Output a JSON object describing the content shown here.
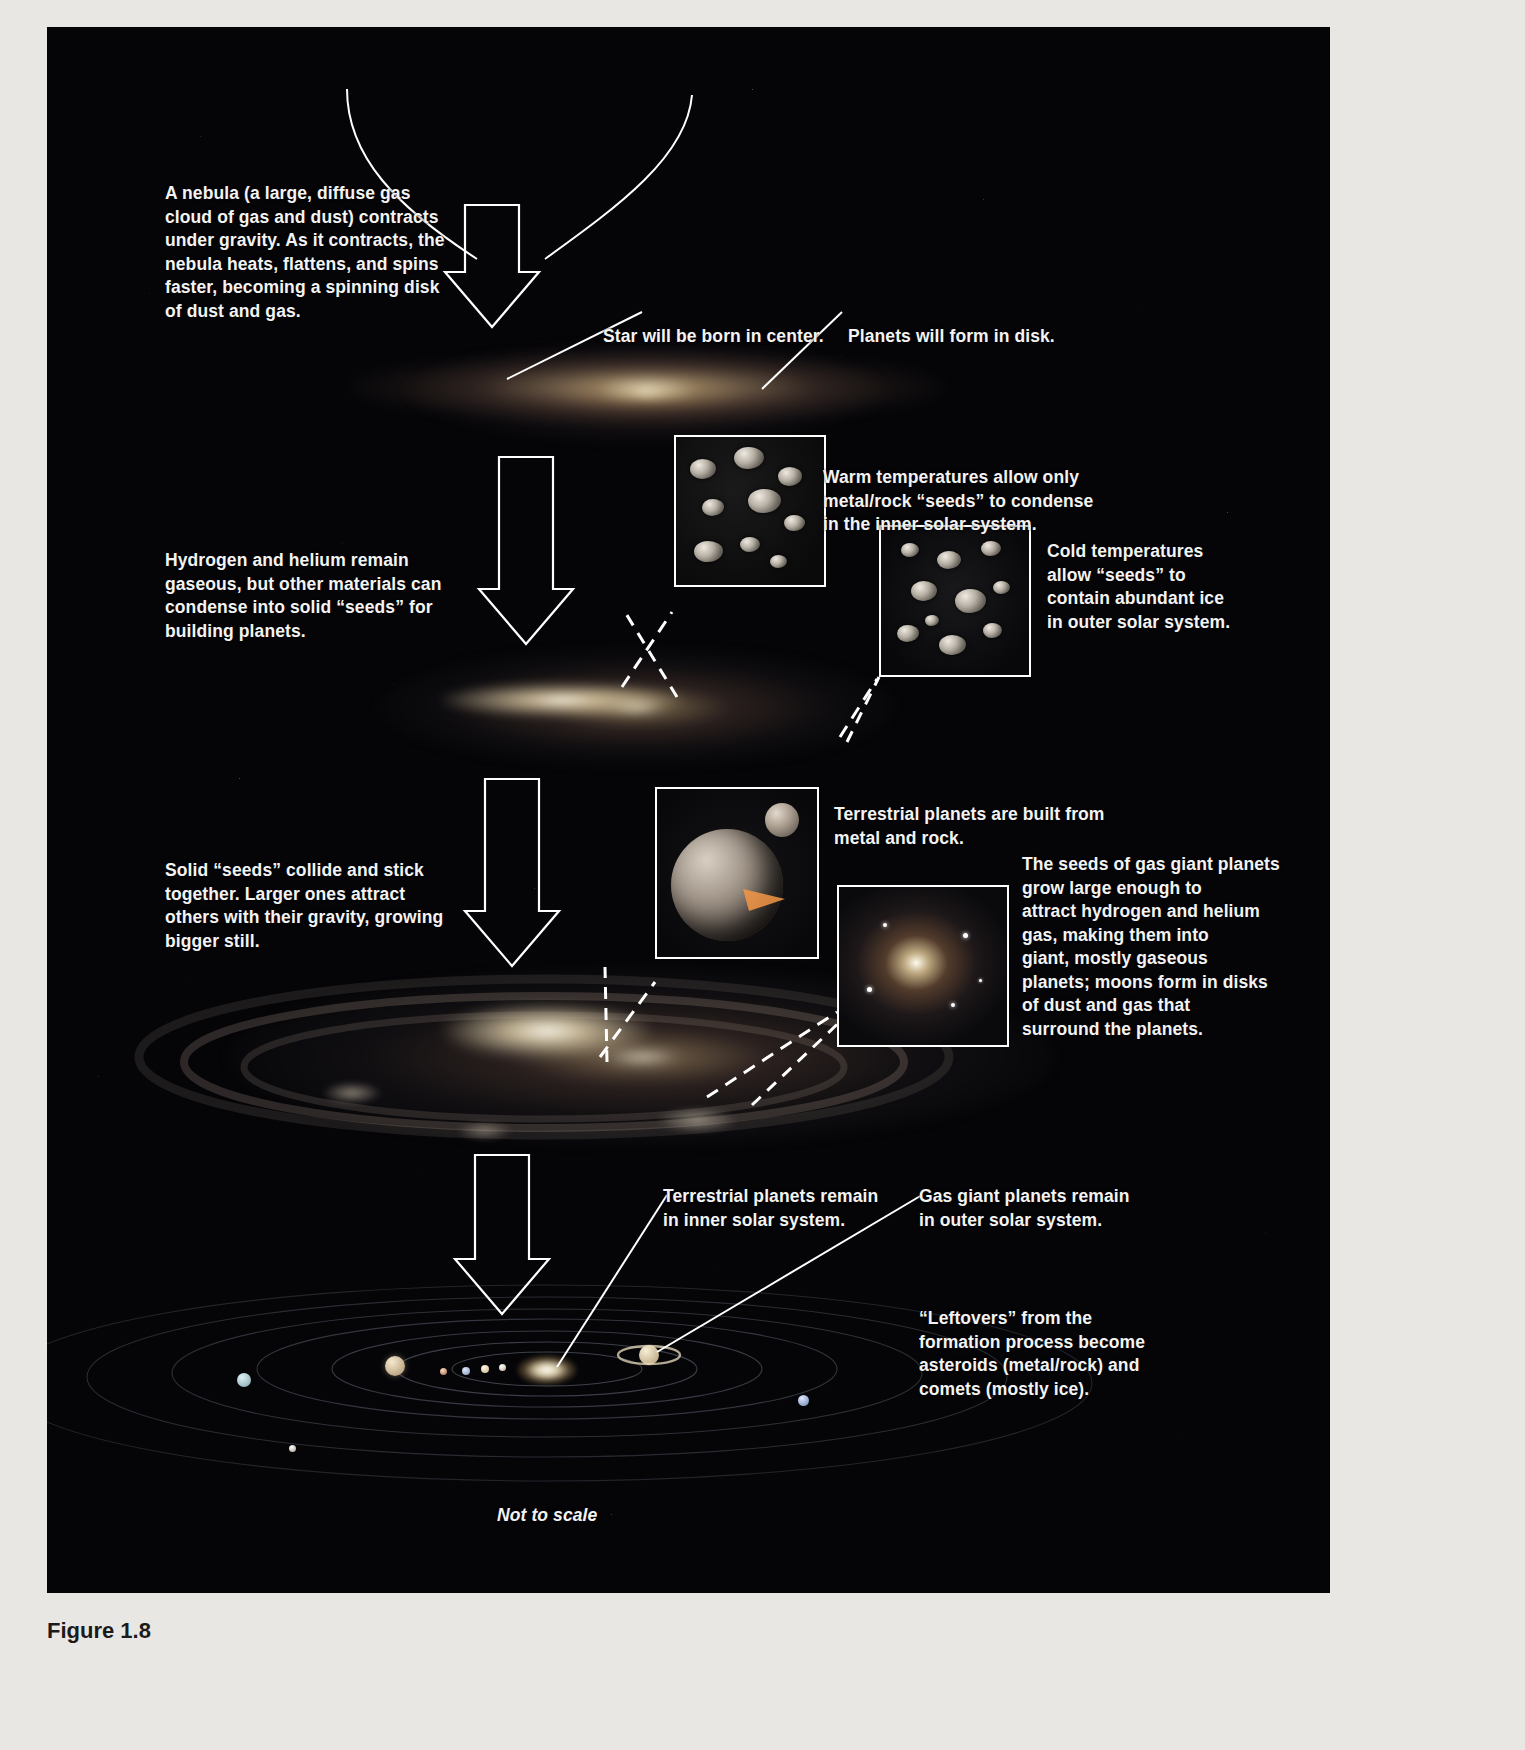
{
  "figure": {
    "caption_label": "Figure 1.8",
    "scale_note": "Not to scale"
  },
  "colors": {
    "background": "#050508",
    "text": "#f3f3f3",
    "arrow_stroke": "#ffffff",
    "inset_border": "#ffffff",
    "paper": "#e9e7e4"
  },
  "stages": [
    {
      "id": "nebula",
      "text": "A nebula (a large, diffuse gas\ncloud of gas and dust) contracts\nunder gravity. As it contracts, the\nnebula heats, flattens, and spins\nfaster, becoming a spinning disk\nof dust and gas."
    },
    {
      "id": "condensation",
      "text": "Hydrogen and helium remain\ngaseous, but other materials can\ncondense into solid “seeds” for\nbuilding planets."
    },
    {
      "id": "accretion",
      "text": "Solid “seeds” collide and stick\ntogether. Larger ones attract\nothers with their gravity, growing\nbigger still."
    }
  ],
  "callouts": {
    "star_center": "Star will be born in center.",
    "planets_disk": "Planets will form in disk.",
    "warm_seeds": "Warm temperatures allow only\nmetal/rock “seeds” to  condense\nin the inner solar system.",
    "cold_seeds": "Cold temperatures\nallow “seeds” to\ncontain abundant ice\nin outer solar system.",
    "terrestrial_built": "Terrestrial planets are built from\nmetal and rock.",
    "gas_giant_seeds": "The seeds of gas giant planets\ngrow large enough to\nattract hydrogen and helium\ngas, making them into\ngiant, mostly gaseous\nplanets; moons form in disks\nof dust and gas that\nsurround the planets.",
    "terrestrial_remain": "Terrestrial planets remain\nin inner solar system.",
    "gas_giants_remain": "Gas giant planets remain\nin outer solar system.",
    "leftovers": "“Leftovers” from the\nformation process become\nasteroids (metal/rock) and\ncomets (mostly ice)."
  },
  "insets": [
    {
      "id": "metal-rock-seeds",
      "name": "metal-rock-seed-inset"
    },
    {
      "id": "icy-seeds",
      "name": "icy-seed-inset"
    },
    {
      "id": "terrestrial-planet",
      "name": "terrestrial-planet-inset"
    },
    {
      "id": "gas-giant",
      "name": "gas-giant-inset"
    }
  ]
}
